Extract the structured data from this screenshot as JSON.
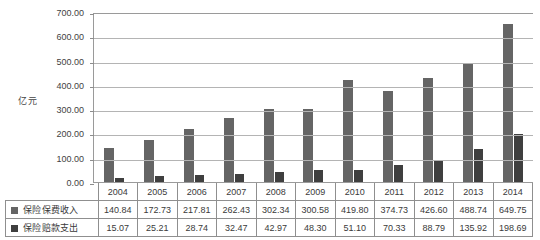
{
  "chart_data": {
    "type": "bar",
    "title": "",
    "xlabel": "",
    "ylabel": "亿元",
    "ylim": [
      0,
      700
    ],
    "ytick_step": 100,
    "ytick_labels": [
      "700.00",
      "600.00",
      "500.00",
      "400.00",
      "300.00",
      "200.00",
      "100.00",
      "0.00"
    ],
    "grid": true,
    "legend_position": "data-table-left",
    "categories": [
      "2004",
      "2005",
      "2006",
      "2007",
      "2008",
      "2009",
      "2010",
      "2011",
      "2012",
      "2013",
      "2014"
    ],
    "series": [
      {
        "name": "保险保费收入",
        "color": "#656565",
        "values": [
          140.84,
          172.73,
          217.81,
          262.43,
          302.34,
          300.58,
          419.8,
          374.73,
          426.6,
          488.74,
          649.75
        ],
        "labels": [
          "140.84",
          "172.73",
          "217.81",
          "262.43",
          "302.34",
          "300.58",
          "419.80",
          "374.73",
          "426.60",
          "488.74",
          "649.75"
        ]
      },
      {
        "name": "保险赔款支出",
        "color": "#3f3f3f",
        "values": [
          15.07,
          25.21,
          28.74,
          32.47,
          42.97,
          48.3,
          51.1,
          70.33,
          88.79,
          135.92,
          198.69
        ],
        "labels": [
          "15.07",
          "25.21",
          "28.74",
          "32.47",
          "42.97",
          "48.30",
          "51.10",
          "70.33",
          "88.79",
          "135.92",
          "198.69"
        ]
      }
    ]
  }
}
